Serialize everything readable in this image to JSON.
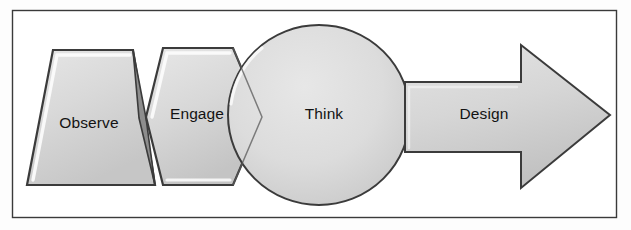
{
  "diagram": {
    "type": "process-flow",
    "title": "",
    "frame": {
      "visible": true,
      "border_color": "#3a3a3a",
      "background_color": "#ffffff"
    },
    "style": {
      "fill_light": "#e2e2e2",
      "fill_mid": "#d2d2d2",
      "fill_dark": "#bdbdbd",
      "outline_color": "#3b3b3b",
      "highlight_color": "#fbfbfb",
      "label_color": "#131313"
    },
    "steps": [
      {
        "id": "observe",
        "label": "Observe",
        "shape": "trapezoid-chevron",
        "order": 1
      },
      {
        "id": "engage",
        "label": "Engage",
        "shape": "chevron-pentagon",
        "order": 2
      },
      {
        "id": "think",
        "label": "Think",
        "shape": "circle",
        "order": 3
      },
      {
        "id": "design",
        "label": "Design",
        "shape": "block-arrow-right",
        "order": 4
      }
    ]
  }
}
